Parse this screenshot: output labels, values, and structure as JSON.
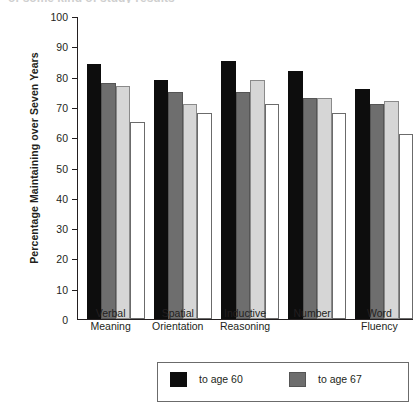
{
  "clipped_title": "of some kind of study results",
  "chart_data": {
    "type": "bar",
    "title": "",
    "xlabel": "",
    "ylabel": "Percentage Maintaining over Seven Years",
    "ylim": [
      0,
      100
    ],
    "ytick_step": 10,
    "yticks": [
      0,
      10,
      20,
      30,
      40,
      50,
      60,
      70,
      80,
      90,
      100
    ],
    "grid": false,
    "legend_position": "bottom",
    "categories": [
      "Verbal Meaning",
      "Spatial Orientation",
      "Inductive Reasoning",
      "Number",
      "Word Fluency"
    ],
    "category_lines": [
      [
        "Verbal",
        "Meaning"
      ],
      [
        "Spatial",
        "Orientation"
      ],
      [
        "Inductive",
        "Reasoning"
      ],
      [
        "Number",
        ""
      ],
      [
        "Word",
        "Fluency"
      ]
    ],
    "series": [
      {
        "name": "to age 60",
        "color": "#0d0d0d",
        "values": [
          84,
          79,
          85,
          82,
          76
        ]
      },
      {
        "name": "to age 67",
        "color": "#6e6e6e",
        "values": [
          78,
          75,
          75,
          73,
          71
        ]
      },
      {
        "name": "to age 74",
        "color": "#d6d6d6",
        "values": [
          77,
          71,
          79,
          73,
          72
        ]
      },
      {
        "name": "to age 81",
        "color": "#ffffff",
        "values": [
          65,
          68,
          71,
          68,
          61
        ]
      }
    ]
  },
  "legend": {
    "entries": [
      {
        "label": "to age 60",
        "color": "#0d0d0d"
      },
      {
        "label": "to age 67",
        "color": "#6e6e6e"
      }
    ]
  }
}
